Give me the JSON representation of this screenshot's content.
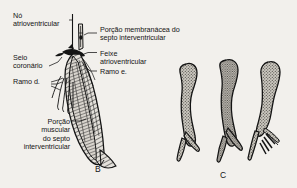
{
  "figure": {
    "background_color": "#f2f0ec",
    "ink_color": "#141414",
    "fill_color": "#b9b5ae",
    "panels": [
      {
        "letter": "B",
        "x": 95,
        "y": 164
      },
      {
        "letter": "C",
        "x": 220,
        "y": 170
      }
    ],
    "labels": [
      {
        "id": "no-atrioventricular",
        "text": "Nó\natrioventricular",
        "x": 13,
        "y": 12,
        "align": "left",
        "width": 62
      },
      {
        "id": "porcao-membranacea",
        "text": "Porção membranácea do\nsepto interventricular",
        "x": 100,
        "y": 26,
        "align": "left",
        "width": 96
      },
      {
        "id": "seio-coronario",
        "text": "Seio\ncoronário",
        "x": 13,
        "y": 54,
        "align": "left",
        "width": 42
      },
      {
        "id": "feixe-atrioventricular",
        "text": "Feixe\natrioventricular",
        "x": 100,
        "y": 50,
        "align": "left",
        "width": 62
      },
      {
        "id": "ramo-d",
        "text": "Ramo d.",
        "x": 13,
        "y": 78,
        "align": "left",
        "width": 38
      },
      {
        "id": "ramo-e",
        "text": "Ramo e.",
        "x": 100,
        "y": 68,
        "align": "left",
        "width": 38
      },
      {
        "id": "porcao-muscular",
        "text": "Porção\nmuscular\ndo septo\ninterventricular",
        "x": 7,
        "y": 118,
        "align": "right",
        "width": 62
      }
    ]
  }
}
